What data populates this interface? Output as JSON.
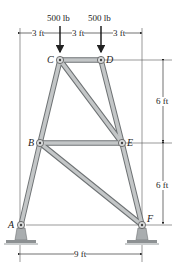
{
  "diagram": {
    "type": "truss",
    "loads": [
      {
        "label": "500 lb",
        "node": "C"
      },
      {
        "label": "500 lb",
        "node": "D"
      }
    ],
    "nodes": {
      "A": {
        "label": "A",
        "x": 21,
        "y": 225
      },
      "B": {
        "label": "B",
        "x": 40,
        "y": 143
      },
      "C": {
        "label": "C",
        "x": 60,
        "y": 60
      },
      "D": {
        "label": "D",
        "x": 101,
        "y": 60
      },
      "E": {
        "label": "E",
        "x": 122,
        "y": 143
      },
      "F": {
        "label": "F",
        "x": 142,
        "y": 225
      }
    },
    "members": [
      [
        "A",
        "B"
      ],
      [
        "B",
        "C"
      ],
      [
        "C",
        "D"
      ],
      [
        "D",
        "E"
      ],
      [
        "E",
        "F"
      ],
      [
        "B",
        "E"
      ],
      [
        "C",
        "E"
      ],
      [
        "B",
        "F"
      ]
    ],
    "dimensions": {
      "top": [
        "3 ft",
        "3 ft",
        "3 ft"
      ],
      "right": [
        "6 ft",
        "6 ft"
      ],
      "bottom": "9 ft"
    },
    "supports": [
      "A",
      "F"
    ],
    "colors": {
      "member_fill": "#b9bcbd",
      "member_edge": "#6e7274",
      "support_fill": "#a9adaf",
      "line": "#333333"
    }
  }
}
